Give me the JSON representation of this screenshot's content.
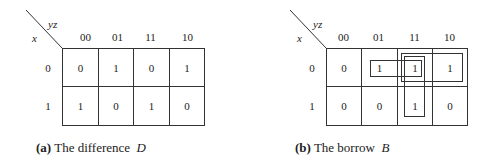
{
  "maps": [
    {
      "id": "difference",
      "corner": {
        "row_var": "x",
        "col_var": "yz"
      },
      "col_headers": [
        "00",
        "01",
        "11",
        "10"
      ],
      "row_headers": [
        "0",
        "1"
      ],
      "cells": [
        [
          "0",
          "1",
          "0",
          "1"
        ],
        [
          "1",
          "0",
          "1",
          "0"
        ]
      ],
      "caption": {
        "tag": "(a)",
        "text": "The difference",
        "symbol": "D"
      },
      "groups": []
    },
    {
      "id": "borrow",
      "corner": {
        "row_var": "x",
        "col_var": "yz"
      },
      "col_headers": [
        "00",
        "01",
        "11",
        "10"
      ],
      "row_headers": [
        "0",
        "1"
      ],
      "cells": [
        [
          "0",
          "1",
          "1",
          "1"
        ],
        [
          "0",
          "0",
          "1",
          "0"
        ]
      ],
      "caption": {
        "tag": "(b)",
        "text": "The borrow",
        "symbol": "B"
      },
      "groups": [
        {
          "name": "x'y'z group",
          "cells": "row0: 01-11"
        },
        {
          "name": "x'y group",
          "cells": "row0: 11-10"
        },
        {
          "name": "yz group",
          "cells": "col 11: rows 0-1"
        }
      ]
    }
  ]
}
